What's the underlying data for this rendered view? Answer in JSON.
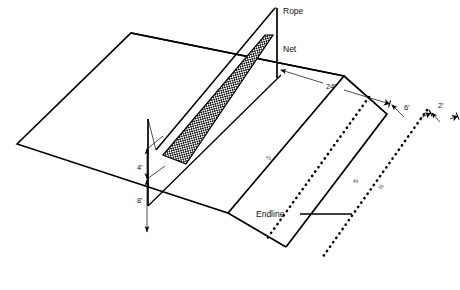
{
  "diagram": {
    "background_color": "#ffffff",
    "line_color": "#000000",
    "labels": {
      "rope": "Rope",
      "net": "Net",
      "endline": "Endline"
    },
    "dimensions": {
      "court_depth": "24'",
      "zone_six": "6'",
      "zone_two": "2'",
      "net_height_lower": "4'",
      "pole_height": "8'"
    },
    "fractions": {
      "center_court": "½",
      "zone_label_a": "⅔",
      "zone_label_b": "½"
    }
  }
}
